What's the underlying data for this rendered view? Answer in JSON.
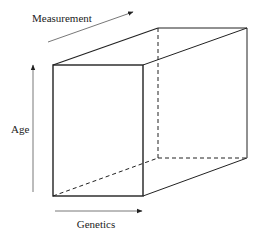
{
  "diagram": {
    "type": "3d-box",
    "axes": {
      "measurement": {
        "label": "Measurement",
        "direction": "depth (diagonal up-right)"
      },
      "age": {
        "label": "Age",
        "direction": "vertical (up)"
      },
      "genetics": {
        "label": "Genetics",
        "direction": "horizontal (right)"
      }
    },
    "colors": {
      "line": "#222222",
      "axis_line": "#555555",
      "background": "#ffffff"
    },
    "edges": {
      "visible": "solid",
      "hidden": "dashed"
    }
  }
}
